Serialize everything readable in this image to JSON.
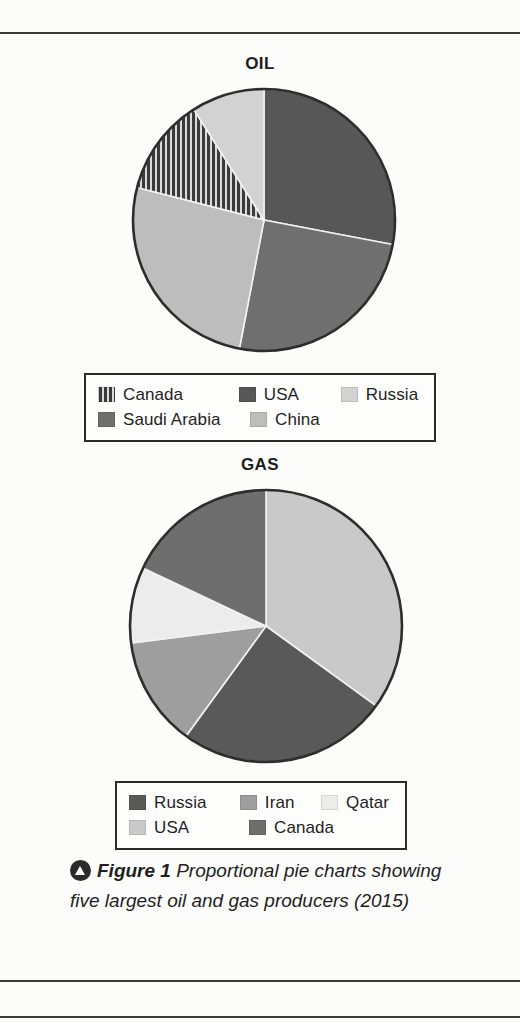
{
  "figure": {
    "marker_icon": "triangle-up-circle-icon",
    "label": "Figure 1",
    "caption": "Proportional pie charts showing five largest oil and gas producers (2015)"
  },
  "charts": {
    "oil": {
      "title": "OIL",
      "legend": [
        {
          "label": "Canada",
          "fill": "hatch",
          "color": "#3b3b3b"
        },
        {
          "label": "USA",
          "fill": "solid",
          "color": "#575757"
        },
        {
          "label": "Russia",
          "fill": "solid",
          "color": "#d2d2d2"
        },
        {
          "label": "Saudi Arabia",
          "fill": "solid",
          "color": "#6f6f6f"
        },
        {
          "label": "China",
          "fill": "solid",
          "color": "#bdbdbd"
        }
      ]
    },
    "gas": {
      "title": "GAS",
      "legend": [
        {
          "label": "Russia",
          "fill": "solid",
          "color": "#595959"
        },
        {
          "label": "Iran",
          "fill": "solid",
          "color": "#9e9e9e"
        },
        {
          "label": "Qatar",
          "fill": "solid",
          "color": "#ececec"
        },
        {
          "label": "USA",
          "fill": "solid",
          "color": "#c9c9c9"
        },
        {
          "label": "Canada",
          "fill": "solid",
          "color": "#6e6e6e"
        }
      ]
    }
  },
  "chart_data": [
    {
      "type": "pie",
      "title": "OIL",
      "id": "oil",
      "categories": [
        "USA",
        "Saudi Arabia",
        "China",
        "Canada",
        "Russia"
      ],
      "values": [
        28,
        25,
        26,
        12,
        9
      ],
      "unit": "percent of total shown",
      "start_angle_deg": 0,
      "direction": "clockwise",
      "slice_angles_deg": [
        100.8,
        90.0,
        93.6,
        43.2,
        32.4
      ],
      "colors": [
        "#575757",
        "#6f6f6f",
        "#bdbdbd",
        "#3b3b3b",
        "#d2d2d2"
      ],
      "patterns": [
        "solid",
        "solid",
        "solid",
        "hatch",
        "solid"
      ],
      "legend_position": "below",
      "grid": false
    },
    {
      "type": "pie",
      "title": "GAS",
      "id": "gas",
      "categories": [
        "USA",
        "Russia",
        "Iran",
        "Qatar",
        "Canada"
      ],
      "values": [
        35,
        25,
        13,
        9,
        18
      ],
      "unit": "percent of total shown",
      "start_angle_deg": 0,
      "direction": "clockwise",
      "slice_angles_deg": [
        126.0,
        90.0,
        46.8,
        32.4,
        64.8
      ],
      "colors": [
        "#c9c9c9",
        "#595959",
        "#9e9e9e",
        "#ececec",
        "#6e6e6e"
      ],
      "patterns": [
        "solid",
        "solid",
        "solid",
        "solid",
        "solid"
      ],
      "legend_position": "below",
      "grid": false
    }
  ]
}
